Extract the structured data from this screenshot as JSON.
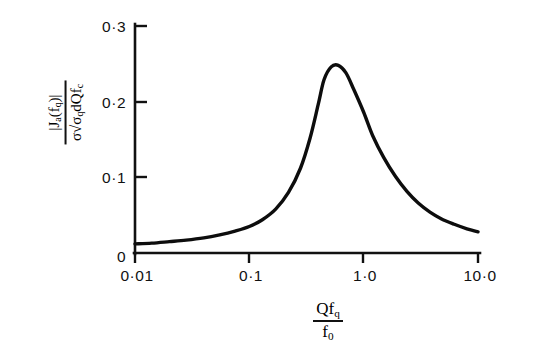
{
  "chart_data": {
    "type": "line",
    "title": "",
    "xlabel": "Qf_q / f_0",
    "ylabel": "|J_a(f_q)| / (sigma sqrt(sigma_q) dQ / f_c)",
    "xscale": "log",
    "xlim": [
      0.01,
      10.0
    ],
    "ylim": [
      0.0,
      0.3
    ],
    "grid": false,
    "legend": null,
    "xticks": [
      0.01,
      0.1,
      1.0,
      10.0
    ],
    "xticklabels": [
      "0·01",
      "0·1",
      "1·0",
      "10·0"
    ],
    "yticks": [
      0,
      0.1,
      0.2,
      0.3
    ],
    "yticklabels": [
      "0",
      "0·1",
      "0·2",
      "0·3"
    ],
    "series": [
      {
        "name": "spectral response",
        "x": [
          0.01,
          0.014,
          0.02,
          0.028,
          0.04,
          0.055,
          0.075,
          0.1,
          0.13,
          0.17,
          0.22,
          0.28,
          0.34,
          0.4,
          0.45,
          0.52,
          0.6,
          0.7,
          0.82,
          1.0,
          1.2,
          1.5,
          1.9,
          2.4,
          3.0,
          3.8,
          4.8,
          6.2,
          8.0,
          10.0
        ],
        "y": [
          0.012,
          0.013,
          0.015,
          0.017,
          0.02,
          0.024,
          0.029,
          0.035,
          0.044,
          0.058,
          0.08,
          0.112,
          0.152,
          0.196,
          0.229,
          0.246,
          0.248,
          0.238,
          0.216,
          0.186,
          0.155,
          0.126,
          0.101,
          0.081,
          0.066,
          0.054,
          0.045,
          0.038,
          0.032,
          0.028
        ],
        "peak_x": 0.5,
        "peak_y": 0.248
      }
    ]
  },
  "axes": {
    "x_title": {
      "numerator_main": "Qf",
      "numerator_sub": "q",
      "denominator_main": "f",
      "denominator_sub": "0"
    },
    "y_title": {
      "numerator": "|J",
      "numerator_sub_a": "a",
      "numerator_mid": "(f",
      "numerator_sub_q": "q",
      "numerator_end": ")|",
      "den_sigma": "σ",
      "den_radical": "√",
      "den_sigma_q": "σ",
      "den_sigma_q_sub": "q",
      "den_dq": "dQ",
      "den_fc_main": "f",
      "den_fc_sub": "c"
    }
  }
}
